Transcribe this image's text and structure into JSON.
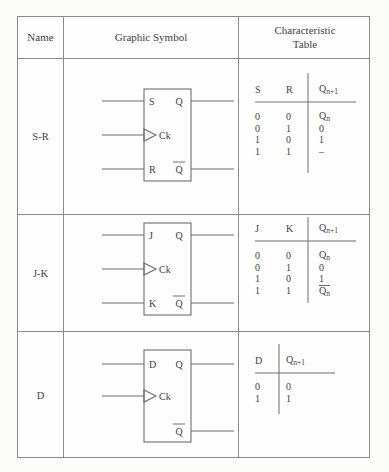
{
  "document": {
    "title": "Flip-Flop Types: Graphic Symbols and Characteristic Tables"
  },
  "header": {
    "name": "Name",
    "graphic_symbol": "Graphic Symbol",
    "characteristic_table_line1": "Characteristic",
    "characteristic_table_line2": "Table"
  },
  "rows": [
    {
      "name": "S-R",
      "symbol": {
        "inputs": [
          "S",
          "Ck",
          "R"
        ],
        "outputs": [
          "Q",
          "Q̅"
        ],
        "clock_label": "Ck",
        "clock_marker": "triangle"
      },
      "table": {
        "headers": [
          "S",
          "R",
          "Q",
          "n+1"
        ],
        "col1": "S",
        "col2": "R",
        "col3_base": "Q",
        "col3_sub": "n+1",
        "data": [
          {
            "a": "0",
            "b": "0",
            "next": "Q",
            "next_sub": "n",
            "overbar": false
          },
          {
            "a": "0",
            "b": "1",
            "next": "0",
            "next_sub": "",
            "overbar": false
          },
          {
            "a": "1",
            "b": "0",
            "next": "1",
            "next_sub": "",
            "overbar": false
          },
          {
            "a": "1",
            "b": "1",
            "next": "–",
            "next_sub": "",
            "overbar": false
          }
        ]
      }
    },
    {
      "name": "J-K",
      "symbol": {
        "inputs": [
          "J",
          "Ck",
          "K"
        ],
        "outputs": [
          "Q",
          "Q̅"
        ],
        "clock_label": "Ck",
        "clock_marker": "triangle"
      },
      "table": {
        "col1": "J",
        "col2": "K",
        "col3_base": "Q",
        "col3_sub": "n+1",
        "data": [
          {
            "a": "0",
            "b": "0",
            "next": "Q",
            "next_sub": "n",
            "overbar": false
          },
          {
            "a": "0",
            "b": "1",
            "next": "0",
            "next_sub": "",
            "overbar": false
          },
          {
            "a": "1",
            "b": "0",
            "next": "1",
            "next_sub": "",
            "overbar": false
          },
          {
            "a": "1",
            "b": "1",
            "next": "Q",
            "next_sub": "n",
            "overbar": true
          }
        ]
      }
    },
    {
      "name": "D",
      "symbol": {
        "inputs": [
          "D",
          "Ck"
        ],
        "outputs": [
          "Q",
          "Q̅"
        ],
        "clock_label": "Ck",
        "clock_marker": "triangle"
      },
      "table": {
        "col1": "D",
        "col3_base": "Q",
        "col3_sub": "n+1",
        "data": [
          {
            "a": "0",
            "next": "0",
            "next_sub": "",
            "overbar": false
          },
          {
            "a": "1",
            "next": "1",
            "next_sub": "",
            "overbar": false
          }
        ]
      }
    }
  ],
  "colors": {
    "page_background": "#fcfcfb",
    "grid_line": "#8b8b8b",
    "symbol_line": "#6e6e6e",
    "text": "#3e3e3e"
  }
}
